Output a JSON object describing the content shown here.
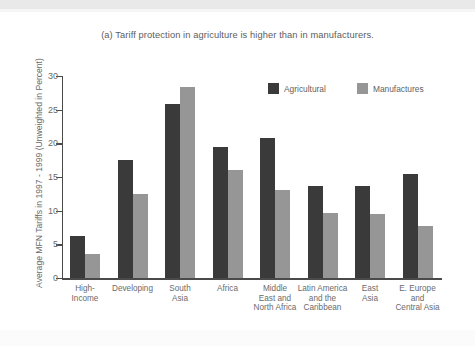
{
  "chart_data": {
    "type": "bar",
    "title": "(a) Tariff protection in agriculture is higher than in manufacturers.",
    "xlabel": "",
    "ylabel": "Average MFN Tariffs in 1997 - 1999 (Unweighted in Percent)",
    "ylim": [
      0,
      30
    ],
    "yticks": [
      0,
      5,
      10,
      15,
      20,
      25,
      30
    ],
    "grid": false,
    "legend_position": "top-right",
    "categories": [
      "High-\nIncome",
      "Developing",
      "South\nAsia",
      "Africa",
      "Middle\nEast and\nNorth Africa",
      "Latin America\nand the\nCaribbean",
      "East\nAsia",
      "E. Europe\nand\nCentral Asia"
    ],
    "series": [
      {
        "name": "Agricultural",
        "color": "#3a3a3a",
        "values": [
          6.2,
          17.5,
          25.9,
          19.4,
          20.8,
          13.6,
          13.6,
          15.4
        ]
      },
      {
        "name": "Manufactures",
        "color": "#969696",
        "values": [
          3.5,
          12.5,
          28.4,
          16.1,
          13.1,
          9.6,
          9.5,
          7.7
        ]
      }
    ]
  },
  "legend": {
    "items": [
      {
        "label": "Agricultural",
        "color": "#3a3a3a"
      },
      {
        "label": "Manufactures",
        "color": "#969696"
      }
    ]
  },
  "axis": {
    "y_tick_labels": [
      "30",
      "25",
      "20",
      "15",
      "10",
      "5",
      "0"
    ]
  }
}
